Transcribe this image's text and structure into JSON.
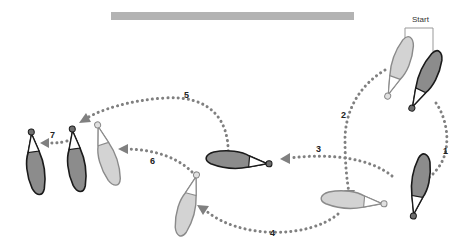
{
  "diagram": {
    "title_bar": "",
    "start_label": "Start",
    "steps": [
      {
        "id": 1,
        "label": "1"
      },
      {
        "id": 2,
        "label": "2"
      },
      {
        "id": 3,
        "label": "3"
      },
      {
        "id": 4,
        "label": "4"
      },
      {
        "id": 5,
        "label": "5"
      },
      {
        "id": 6,
        "label": "6"
      },
      {
        "id": 7,
        "label": "7"
      }
    ],
    "colors": {
      "dark_figure": "#8c8c8c",
      "light_figure": "#d3d3d3",
      "dotted_path": "#808080",
      "title_bar": "#b3b3b3"
    }
  }
}
